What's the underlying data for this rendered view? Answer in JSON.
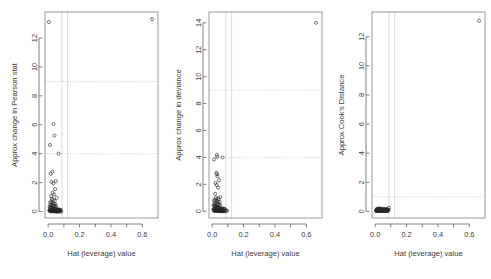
{
  "figure": {
    "kind": "regression-diagnostic-panels",
    "panel_count": 3,
    "background": "#ffffff",
    "point_symbol": "open-circle",
    "point_color": "#262626",
    "refline_color": "#b9b9b9",
    "vline_color": "#d2d2d2"
  },
  "chart_data": [
    {
      "type": "scatter",
      "title": "",
      "xlabel": "Hat (leverage) value",
      "ylabel": "Approx change in Pearson stat",
      "xlim": [
        -0.02,
        0.7
      ],
      "ylim": [
        -0.45,
        13.8
      ],
      "xticks": [
        0.0,
        0.2,
        0.4,
        0.6
      ],
      "xticklabels": [
        "0.0",
        "0.2",
        "0.4",
        "0.6"
      ],
      "xminorticks": [
        0.1,
        0.3,
        0.5
      ],
      "yticks": [
        0,
        2,
        4,
        6,
        8,
        10,
        12
      ],
      "yticklabels": [
        "0",
        "2",
        "4",
        "6",
        "8",
        "10",
        "12"
      ],
      "grid": false,
      "hlines": [
        4,
        9
      ],
      "vlines": [
        0.088,
        0.124
      ],
      "x": [
        0.005,
        0.662,
        0.034,
        0.04,
        0.012,
        0.066,
        0.027,
        0.049,
        0.021,
        0.033,
        0.016,
        0.044,
        0.029,
        0.038,
        0.019,
        0.055,
        0.024,
        0.031,
        0.042,
        0.018,
        0.012,
        0.026,
        0.036,
        0.048,
        0.022,
        0.015,
        0.03,
        0.039,
        0.044,
        0.051,
        0.009,
        0.013,
        0.017,
        0.02,
        0.023,
        0.025,
        0.028,
        0.032,
        0.035,
        0.037,
        0.041,
        0.045,
        0.047,
        0.052,
        0.058,
        0.061,
        0.068,
        0.072,
        0.076,
        0.081,
        0.008,
        0.011,
        0.014,
        0.018,
        0.021,
        0.024,
        0.027,
        0.03,
        0.033,
        0.036,
        0.039,
        0.043,
        0.046,
        0.05,
        0.054,
        0.057,
        0.06,
        0.064,
        0.069,
        0.074,
        0.01,
        0.013,
        0.016,
        0.019,
        0.022,
        0.026,
        0.029,
        0.034,
        0.038,
        0.042,
        0.046,
        0.049,
        0.053,
        0.056,
        0.059,
        0.063,
        0.067,
        0.071,
        0.078,
        0.084
      ],
      "y": [
        13.1,
        13.3,
        6.05,
        5.25,
        4.6,
        4.0,
        2.75,
        2.1,
        2.05,
        1.95,
        2.6,
        1.55,
        1.3,
        1.18,
        1.05,
        0.95,
        0.88,
        0.8,
        0.74,
        0.68,
        0.62,
        0.58,
        0.54,
        0.5,
        0.47,
        0.44,
        0.41,
        0.39,
        0.36,
        0.34,
        0.32,
        0.3,
        0.28,
        0.27,
        0.25,
        0.24,
        0.22,
        0.21,
        0.2,
        0.19,
        0.18,
        0.17,
        0.16,
        0.15,
        0.14,
        0.135,
        0.13,
        0.12,
        0.115,
        0.11,
        0.105,
        0.1,
        0.095,
        0.09,
        0.085,
        0.08,
        0.078,
        0.075,
        0.072,
        0.068,
        0.065,
        0.062,
        0.058,
        0.055,
        0.052,
        0.05,
        0.047,
        0.044,
        0.04,
        0.038,
        0.035,
        0.032,
        0.03,
        0.028,
        0.025,
        0.023,
        0.021,
        0.019,
        0.017,
        0.015,
        0.013,
        0.012,
        0.011,
        0.01,
        0.009,
        0.008,
        0.007,
        0.006,
        0.005,
        0.004
      ]
    },
    {
      "type": "scatter",
      "title": "",
      "xlabel": "Hat (leverage) value",
      "ylabel": "Approx change in deviance",
      "xlim": [
        -0.02,
        0.7
      ],
      "ylim": [
        -0.5,
        14.8
      ],
      "xticks": [
        0.0,
        0.2,
        0.4,
        0.6
      ],
      "xticklabels": [
        "0.0",
        "0.2",
        "0.4",
        "0.6"
      ],
      "xminorticks": [
        0.1,
        0.3,
        0.5
      ],
      "yticks": [
        0,
        2,
        4,
        6,
        8,
        10,
        12,
        14
      ],
      "yticklabels": [
        "0",
        "2",
        "4",
        "6",
        "8",
        "10",
        "12",
        "14"
      ],
      "grid": false,
      "hlines": [
        4,
        9
      ],
      "vlines": [
        0.088,
        0.124
      ],
      "x": [
        0.662,
        0.03,
        0.032,
        0.012,
        0.066,
        0.027,
        0.031,
        0.034,
        0.021,
        0.044,
        0.028,
        0.038,
        0.019,
        0.052,
        0.024,
        0.036,
        0.042,
        0.018,
        0.012,
        0.026,
        0.036,
        0.048,
        0.022,
        0.015,
        0.03,
        0.039,
        0.044,
        0.051,
        0.009,
        0.013,
        0.017,
        0.02,
        0.023,
        0.025,
        0.028,
        0.032,
        0.035,
        0.037,
        0.041,
        0.045,
        0.047,
        0.052,
        0.058,
        0.061,
        0.068,
        0.072,
        0.076,
        0.081,
        0.008,
        0.011,
        0.014,
        0.018,
        0.021,
        0.024,
        0.027,
        0.03,
        0.033,
        0.036,
        0.039,
        0.043,
        0.046,
        0.05,
        0.054,
        0.057,
        0.06,
        0.064,
        0.069,
        0.074,
        0.01,
        0.013,
        0.016,
        0.019,
        0.022,
        0.026,
        0.029,
        0.034,
        0.038,
        0.042,
        0.046,
        0.049,
        0.053,
        0.056,
        0.059,
        0.063,
        0.067,
        0.071,
        0.078,
        0.084,
        0.09,
        0.095
      ],
      "y": [
        14.0,
        4.2,
        4.05,
        3.85,
        4.0,
        2.85,
        2.75,
        2.6,
        2.1,
        2.3,
        1.95,
        1.75,
        1.3,
        1.05,
        1.0,
        0.95,
        0.9,
        0.85,
        0.8,
        0.76,
        0.72,
        0.68,
        0.64,
        0.6,
        0.57,
        0.54,
        0.51,
        0.48,
        0.45,
        0.42,
        0.4,
        0.38,
        0.36,
        0.34,
        0.32,
        0.3,
        0.285,
        0.27,
        0.255,
        0.24,
        0.23,
        0.22,
        0.21,
        0.2,
        0.19,
        0.18,
        0.17,
        0.16,
        0.15,
        0.145,
        0.14,
        0.13,
        0.125,
        0.12,
        0.115,
        0.11,
        0.105,
        0.1,
        0.095,
        0.09,
        0.085,
        0.08,
        0.075,
        0.07,
        0.065,
        0.06,
        0.055,
        0.05,
        0.048,
        0.045,
        0.042,
        0.04,
        0.037,
        0.034,
        0.031,
        0.028,
        0.025,
        0.022,
        0.02,
        0.018,
        0.016,
        0.014,
        0.012,
        0.011,
        0.01,
        0.009,
        0.008,
        0.007,
        0.05,
        0.04
      ]
    },
    {
      "type": "scatter",
      "title": "",
      "xlabel": "Hat (leverage) value",
      "ylabel": "Approx Cook's Distance",
      "xlim": [
        -0.02,
        0.7
      ],
      "ylim": [
        -0.45,
        13.7
      ],
      "xticks": [
        0.0,
        0.2,
        0.4,
        0.6
      ],
      "xticklabels": [
        "0.0",
        "0.2",
        "0.4",
        "0.6"
      ],
      "xminorticks": [
        0.1,
        0.3,
        0.5
      ],
      "yticks": [
        0,
        2,
        4,
        6,
        8,
        10,
        12
      ],
      "yticklabels": [
        "0",
        "2",
        "4",
        "6",
        "8",
        "10",
        "12"
      ],
      "grid": false,
      "hlines": [
        1
      ],
      "vlines": [
        0.088,
        0.124
      ],
      "x": [
        0.662,
        0.005,
        0.008,
        0.01,
        0.012,
        0.014,
        0.016,
        0.018,
        0.02,
        0.022,
        0.024,
        0.026,
        0.028,
        0.03,
        0.032,
        0.034,
        0.036,
        0.038,
        0.04,
        0.042,
        0.044,
        0.046,
        0.048,
        0.05,
        0.052,
        0.054,
        0.056,
        0.058,
        0.06,
        0.062,
        0.064,
        0.066,
        0.068,
        0.07,
        0.072,
        0.074,
        0.076,
        0.078,
        0.08,
        0.082,
        0.009,
        0.013,
        0.017,
        0.021,
        0.025,
        0.029,
        0.033,
        0.037,
        0.041,
        0.045,
        0.049,
        0.053,
        0.057,
        0.061,
        0.065,
        0.069,
        0.073,
        0.077,
        0.081,
        0.085,
        0.007,
        0.011,
        0.015,
        0.019,
        0.023,
        0.027,
        0.031,
        0.035,
        0.039,
        0.043,
        0.047,
        0.051,
        0.055,
        0.059,
        0.063,
        0.067,
        0.071,
        0.075,
        0.079,
        0.088
      ],
      "y": [
        13.1,
        0.06,
        0.1,
        0.14,
        0.18,
        0.12,
        0.09,
        0.16,
        0.2,
        0.11,
        0.08,
        0.13,
        0.17,
        0.21,
        0.15,
        0.1,
        0.07,
        0.12,
        0.19,
        0.14,
        0.09,
        0.16,
        0.11,
        0.08,
        0.13,
        0.18,
        0.1,
        0.07,
        0.12,
        0.15,
        0.09,
        0.11,
        0.14,
        0.08,
        0.1,
        0.13,
        0.16,
        0.09,
        0.07,
        0.12,
        0.05,
        0.08,
        0.06,
        0.09,
        0.07,
        0.1,
        0.05,
        0.08,
        0.06,
        0.09,
        0.04,
        0.07,
        0.05,
        0.08,
        0.06,
        0.09,
        0.04,
        0.07,
        0.05,
        0.1,
        0.03,
        0.05,
        0.04,
        0.06,
        0.03,
        0.05,
        0.04,
        0.06,
        0.03,
        0.05,
        0.04,
        0.06,
        0.03,
        0.05,
        0.04,
        0.06,
        0.03,
        0.05,
        0.04,
        0.25
      ]
    }
  ]
}
